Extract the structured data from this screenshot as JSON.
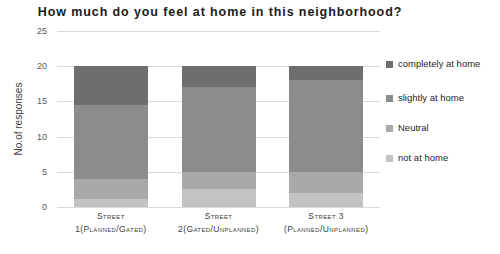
{
  "chart_data": {
    "type": "bar",
    "subtype": "stacked-column",
    "title": "How much do you feel at home in this neighborhood?",
    "xlabel": "",
    "ylabel": "No.of responses",
    "ylim": [
      0,
      25
    ],
    "yticks": [
      0,
      5,
      10,
      15,
      20,
      25
    ],
    "grid": true,
    "legend_position": "right",
    "categories": [
      "Street 1(Planned/Gated)",
      "Street 2(Gated/Unplanned)",
      "Street 3 (Planned/Unplanned)"
    ],
    "category_lines": [
      [
        "Street",
        "1(Planned/Gated)"
      ],
      [
        "Street",
        "2(Gated/Unplanned)"
      ],
      [
        "Street 3",
        "(Planned/Unplanned)"
      ]
    ],
    "series": [
      {
        "name": "not at home",
        "color": "#c3c3c3",
        "values": [
          1.2,
          2.5,
          2.0
        ]
      },
      {
        "name": "Neutral",
        "color": "#a9a9a9",
        "values": [
          2.8,
          2.5,
          3.0
        ]
      },
      {
        "name": "slightly at home",
        "color": "#8c8c8c",
        "values": [
          10.5,
          12.0,
          13.0
        ]
      },
      {
        "name": "completely at home",
        "color": "#6e6e6e",
        "values": [
          5.5,
          3.0,
          2.0
        ]
      }
    ],
    "stack_totals": [
      20,
      20,
      20
    ]
  },
  "legend": {
    "items": [
      {
        "label": "completely at home",
        "color": "#6e6e6e"
      },
      {
        "label": "slightly at home",
        "color": "#8c8c8c"
      },
      {
        "label": "Neutral",
        "color": "#a9a9a9"
      },
      {
        "label": "not at home",
        "color": "#c3c3c3"
      }
    ]
  },
  "axis": {
    "y_tick_labels": [
      "25",
      "20",
      "15",
      "10",
      "5",
      "0"
    ],
    "y_axis_title": "No.of responses"
  }
}
